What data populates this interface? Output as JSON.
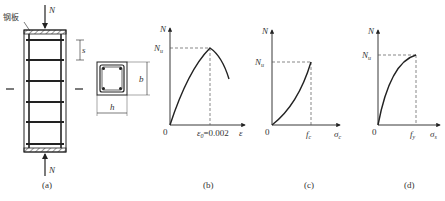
{
  "figure": {
    "panels": [
      {
        "id": "a",
        "caption": "(a)",
        "labels": {
          "steel_plate": "钢板",
          "load_top": "N",
          "load_bottom": "N",
          "tie_spacing": "s",
          "section_width": "h",
          "section_depth": "b"
        }
      },
      {
        "id": "b",
        "caption": "(b)",
        "y_axis": "N",
        "y_mark": "N",
        "y_mark_sub": "u",
        "origin": "0",
        "x_mark": "ε",
        "x_mark_sub": "0",
        "x_mark_value": "=0.002",
        "x_axis": "ε"
      },
      {
        "id": "c",
        "caption": "(c)",
        "y_axis": "N",
        "y_mark": "N",
        "y_mark_sub": "u",
        "origin": "0",
        "x_mark": "f",
        "x_mark_sub": "c",
        "x_axis": "σ",
        "x_axis_sub": "c"
      },
      {
        "id": "d",
        "caption": "(d)",
        "y_axis": "N",
        "y_mark": "N",
        "y_mark_sub": "u",
        "origin": "0",
        "x_mark": "f",
        "x_mark_sub": "y",
        "x_axis": "σ",
        "x_axis_sub": "s"
      }
    ]
  },
  "colors": {
    "line": "#222222",
    "dash": "#555555",
    "text": "#333333"
  }
}
